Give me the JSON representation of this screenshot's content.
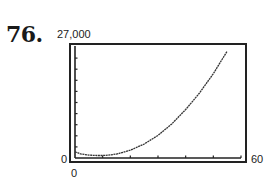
{
  "problem_number": "76.",
  "chart_data": {
    "type": "line",
    "title": "",
    "xlabel": "",
    "ylabel": "",
    "xlim": [
      0,
      60
    ],
    "ylim": [
      0,
      27000
    ],
    "x_tick_labels": [
      "0",
      "60"
    ],
    "y_tick_labels": [
      "0",
      "27,000"
    ],
    "x_tick_count": 6,
    "y_tick_count": 10,
    "grid": false,
    "legend": null,
    "series": [
      {
        "name": "graphing-calculator curve",
        "x": [
          0,
          2,
          5,
          8,
          10,
          12,
          15,
          20,
          25,
          30,
          35,
          40,
          45,
          50,
          55
        ],
        "values": [
          1500,
          1000,
          700,
          600,
          600,
          700,
          950,
          1900,
          3400,
          5500,
          8300,
          11800,
          15800,
          20500,
          26000
        ]
      }
    ]
  },
  "axis_labels": {
    "y_max": "27,000",
    "y_min": "0",
    "x_min": "0",
    "x_max": "60"
  }
}
